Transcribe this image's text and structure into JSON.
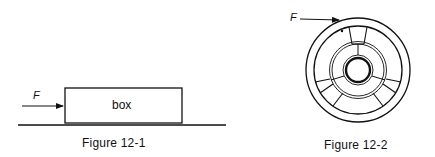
{
  "figures": [
    {
      "id": "12-1",
      "caption": "Figure 12-1",
      "force_label": "F",
      "box_label": "box",
      "elements": [
        "horizontal force arrow",
        "rectangular box",
        "ground line"
      ]
    },
    {
      "id": "12-2",
      "caption": "Figure 12-2",
      "force_label": "F",
      "elements": [
        "tangential force arrow",
        "spoked wheel with outer rim, inner double ring and hub"
      ]
    }
  ],
  "colors": {
    "line": "#111111",
    "background": "#ffffff"
  }
}
